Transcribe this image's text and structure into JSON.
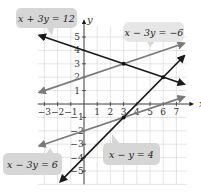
{
  "chart_data": {
    "type": "line",
    "title": "",
    "xlabel": "x",
    "ylabel": "y",
    "xlim": [
      -3.5,
      7.8
    ],
    "ylim": [
      -6,
      5.8
    ],
    "grid": true,
    "x_ticks": [
      -3,
      -2,
      -1,
      1,
      2,
      3,
      4,
      5,
      6,
      7
    ],
    "y_ticks": [
      -5,
      -4,
      -3,
      -2,
      -1,
      1,
      2,
      3,
      4,
      5
    ],
    "series": [
      {
        "name": "x + 3y = 12",
        "equation": "x + 3y = 12",
        "color": "#1a1a1a",
        "x": [
          -3.4,
          7.6
        ],
        "y": [
          5.13,
          1.47
        ]
      },
      {
        "name": "x − 3y = −6",
        "equation": "x − 3y = −6",
        "color": "#7a7a7a",
        "x": [
          -3.4,
          7.6
        ],
        "y": [
          0.87,
          4.53
        ]
      },
      {
        "name": "x − 3y = 6",
        "equation": "x − 3y = 6",
        "color": "#7a7a7a",
        "x": [
          -3.4,
          7.6
        ],
        "y": [
          -3.13,
          0.53
        ]
      },
      {
        "name": "x − y = 4",
        "equation": "x − y = 4",
        "color": "#1a1a1a",
        "x": [
          -1.8,
          7.6
        ],
        "y": [
          -5.8,
          3.6
        ]
      }
    ],
    "points": [
      {
        "x": 3,
        "y": 3
      },
      {
        "x": 6,
        "y": 2
      },
      {
        "x": 3,
        "y": -1
      }
    ],
    "annotations": [
      "x + 3y = 12",
      "x − 3y = −6",
      "x − 3y = 6",
      "x − y = 4"
    ]
  },
  "labels": {
    "eq1": "x + 3y = 12",
    "eq2": "x − 3y = −6",
    "eq3": "x − 3y = 6",
    "eq4": "x − y = 4",
    "x_axis": "x",
    "y_axis": "y"
  }
}
